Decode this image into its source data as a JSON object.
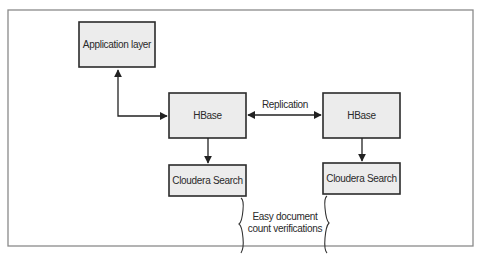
{
  "diagram": {
    "nodes": {
      "app": {
        "label": "Application layer"
      },
      "hbase_left": {
        "label": "HBase"
      },
      "hbase_right": {
        "label": "HBase"
      },
      "search_left": {
        "label": "Cloudera Search"
      },
      "search_right": {
        "label": "Cloudera Search"
      }
    },
    "edges": [
      {
        "from": "app",
        "to": "hbase_left",
        "direction": "bidirectional",
        "label": ""
      },
      {
        "from": "hbase_left",
        "to": "hbase_right",
        "direction": "bidirectional",
        "label": "Replication"
      },
      {
        "from": "hbase_left",
        "to": "search_left",
        "direction": "forward",
        "label": ""
      },
      {
        "from": "hbase_right",
        "to": "search_right",
        "direction": "forward",
        "label": ""
      }
    ],
    "replication_label": "Replication",
    "annotation": {
      "line1": "Easy document",
      "line2": "count verifications"
    }
  }
}
